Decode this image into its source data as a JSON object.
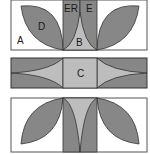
{
  "diagram": {
    "colors": {
      "background": "#ffffff",
      "dark": "#878787",
      "light": "#bdbdbd",
      "outline": "#333333"
    },
    "panels": [
      {
        "name": "top-unit",
        "labels": {
          "A": "A",
          "D": "D",
          "ER": "ER",
          "E": "E",
          "B": "B"
        }
      },
      {
        "name": "middle-sashing",
        "labels": {
          "C": "C"
        }
      },
      {
        "name": "bottom-unit",
        "labels": {}
      }
    ]
  }
}
